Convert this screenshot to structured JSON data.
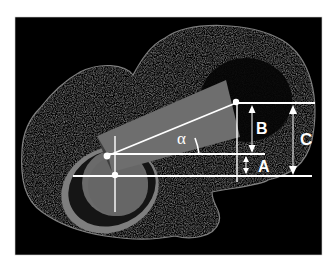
{
  "figure": {
    "labels": {
      "angle": "α",
      "distance_a": "A",
      "distance_b": "B",
      "distance_c": "C"
    },
    "colors": {
      "background": "#000000",
      "bone_texture": "#8a8a8a",
      "implant": "#6e6e6e",
      "head": "#6a6a6a",
      "annotation": "#ffffff",
      "page": "#ffffff"
    }
  }
}
